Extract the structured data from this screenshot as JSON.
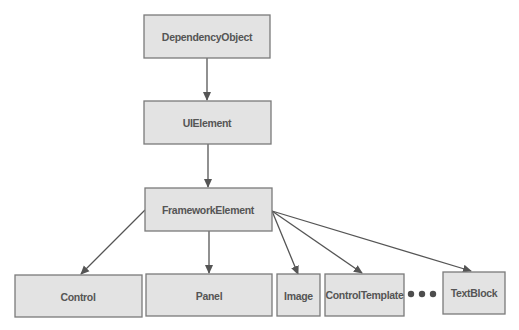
{
  "diagram": {
    "type": "class-hierarchy",
    "nodes": [
      {
        "id": "dependencyobject",
        "label": "DependencyObject"
      },
      {
        "id": "uielement",
        "label": "UIElement"
      },
      {
        "id": "frameworkelement",
        "label": "FrameworkElement"
      },
      {
        "id": "control",
        "label": "Control"
      },
      {
        "id": "panel",
        "label": "Panel"
      },
      {
        "id": "image",
        "label": "Image"
      },
      {
        "id": "controltemplate",
        "label": "ControlTemplate"
      },
      {
        "id": "textblock",
        "label": "TextBlock"
      }
    ],
    "edges": [
      {
        "from": "dependencyobject",
        "to": "uielement"
      },
      {
        "from": "uielement",
        "to": "frameworkelement"
      },
      {
        "from": "frameworkelement",
        "to": "control"
      },
      {
        "from": "frameworkelement",
        "to": "panel"
      },
      {
        "from": "frameworkelement",
        "to": "image"
      },
      {
        "from": "frameworkelement",
        "to": "controltemplate"
      },
      {
        "from": "frameworkelement",
        "to": "textblock"
      }
    ],
    "ellipsis": "more derived classes (•••)",
    "colors": {
      "node_fill": "#e3e3e3",
      "node_border": "#7a7a7a",
      "text": "#555555",
      "arrow": "#555555"
    }
  }
}
